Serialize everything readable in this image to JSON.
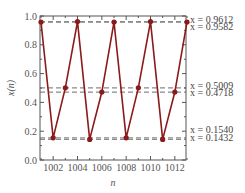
{
  "chart_data": {
    "type": "line",
    "title": "",
    "xlabel": "n",
    "ylabel": "x(n)",
    "xlim": [
      1001,
      1013
    ],
    "ylim": [
      0.0,
      1.0
    ],
    "grid": false,
    "legend": null,
    "x_ticks": [
      1002,
      1004,
      1006,
      1008,
      1010,
      1012
    ],
    "x_tick_labels": [
      "1002",
      "1004",
      "1006",
      "1008",
      "1010",
      "1012"
    ],
    "y_ticks": [
      0.0,
      0.2,
      0.4,
      0.6,
      0.8,
      1.0
    ],
    "y_tick_labels": [
      "0.0",
      "0.2",
      "0.4",
      "0.6",
      "0.8",
      "1.0"
    ],
    "series": [
      {
        "name": "x(n)",
        "color": "#8b1a1a",
        "marker": "circle",
        "x": [
          1001,
          1002,
          1003,
          1004,
          1005,
          1006,
          1007,
          1008,
          1009,
          1010,
          1011,
          1012,
          1013
        ],
        "values": [
          0.9582,
          0.154,
          0.5009,
          0.9612,
          0.1432,
          0.4718,
          0.9582,
          0.154,
          0.5009,
          0.9612,
          0.1432,
          0.4718,
          0.9582
        ]
      }
    ],
    "reference_lines": [
      {
        "y": 0.9612,
        "label": "x = 0.9612",
        "style": "dashed",
        "color": "#8a8a8a"
      },
      {
        "y": 0.9582,
        "label": "x = 0.9582",
        "style": "dashed",
        "color": "#8a8a8a"
      },
      {
        "y": 0.5009,
        "label": "x = 0.5009",
        "style": "dashed",
        "color": "#8a8a8a"
      },
      {
        "y": 0.4718,
        "label": "x = 0.4718",
        "style": "dashed",
        "color": "#8a8a8a"
      },
      {
        "y": 0.154,
        "label": "x = 0.1540",
        "style": "dashed",
        "color": "#8a8a8a"
      },
      {
        "y": 0.1432,
        "label": "x = 0.1432",
        "style": "dashed",
        "color": "#8a8a8a"
      }
    ]
  }
}
